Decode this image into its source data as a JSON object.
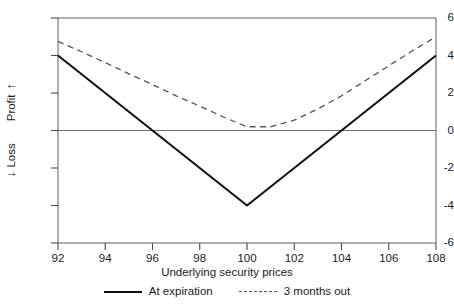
{
  "chart_data": {
    "type": "line",
    "title": "",
    "xlabel": "Underlying security prices",
    "ylabel": "Profit / Loss",
    "ylabel_parts": {
      "up_arrow": "↑",
      "profit": "Profit",
      "loss": "Loss",
      "down_arrow": "↓"
    },
    "xlim": [
      92,
      108
    ],
    "ylim": [
      -6,
      6
    ],
    "xticks": [
      92,
      94,
      96,
      98,
      100,
      102,
      104,
      106,
      108
    ],
    "yticks": [
      6,
      4,
      2,
      0,
      -2,
      -4,
      -6
    ],
    "grid": false,
    "zero_line": 0,
    "legend_position": "below",
    "series": [
      {
        "name": "At expiration",
        "style": "solid",
        "color": "#111111",
        "x": [
          92,
          100,
          108
        ],
        "values": [
          4.0,
          -4.0,
          4.0
        ]
      },
      {
        "name": "3 months out",
        "style": "dashed",
        "color": "#555555",
        "x": [
          92,
          93,
          94,
          95,
          96,
          97,
          98,
          99,
          100,
          101,
          102,
          103,
          104,
          105,
          106,
          107,
          108
        ],
        "values": [
          4.75,
          4.2,
          3.62,
          3.02,
          2.45,
          1.85,
          1.3,
          0.72,
          0.2,
          0.2,
          0.55,
          1.15,
          1.85,
          2.65,
          3.45,
          4.25,
          5.0
        ]
      }
    ],
    "annotations": []
  },
  "legend": {
    "entries": [
      {
        "label": "At expiration",
        "style": "solid"
      },
      {
        "label": "3 months out",
        "style": "dashed"
      }
    ]
  }
}
